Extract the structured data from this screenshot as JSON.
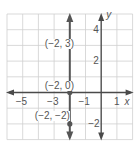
{
  "chart_data": {
    "type": "line",
    "title": "",
    "xlabel": "x",
    "ylabel": "y",
    "xlim": [
      -6,
      2
    ],
    "ylim": [
      -3,
      5
    ],
    "grid": true,
    "x_ticks": [
      {
        "value": -5,
        "label": "−5"
      },
      {
        "value": -3,
        "label": "−3"
      },
      {
        "value": -1,
        "label": "−1"
      },
      {
        "value": 1,
        "label": "1"
      }
    ],
    "y_ticks": [
      {
        "value": 4,
        "label": "4"
      },
      {
        "value": 2,
        "label": "2"
      },
      {
        "value": -2,
        "label": "−2"
      }
    ],
    "series": [
      {
        "name": "vertical line x = -2",
        "x": [
          -2,
          -2,
          -2
        ],
        "y": [
          3,
          0,
          -2
        ],
        "extends": "both directions (arrows)"
      }
    ],
    "points": [
      {
        "x": -2,
        "y": 3,
        "label": "(−2, 3)"
      },
      {
        "x": -2,
        "y": 0,
        "label": "(−2, 0)"
      },
      {
        "x": -2,
        "y": -2,
        "label": "(−2, −2)"
      }
    ],
    "colors": {
      "grid": "#cfcfcf",
      "axis": "#4a4a4a",
      "line": "#555555",
      "point": "#555555",
      "text": "#555555"
    }
  }
}
